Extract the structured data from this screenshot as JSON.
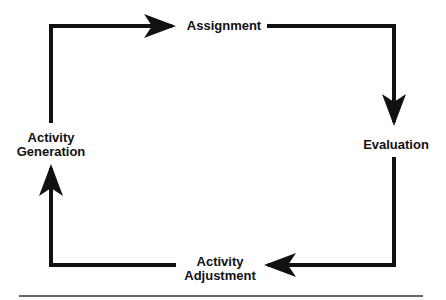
{
  "diagram": {
    "type": "cycle",
    "nodes": [
      {
        "id": "assignment",
        "lines": [
          "Assignment"
        ]
      },
      {
        "id": "evaluation",
        "lines": [
          "Evaluation"
        ]
      },
      {
        "id": "activity-adjustment",
        "lines": [
          "Activity",
          "Adjustment"
        ]
      },
      {
        "id": "activity-generation",
        "lines": [
          "Activity",
          "Generation"
        ]
      }
    ],
    "edges": [
      {
        "from": "activity-generation",
        "to": "assignment",
        "direction": "clockwise"
      },
      {
        "from": "assignment",
        "to": "evaluation",
        "direction": "clockwise"
      },
      {
        "from": "evaluation",
        "to": "activity-adjustment",
        "direction": "clockwise"
      },
      {
        "from": "activity-adjustment",
        "to": "activity-generation",
        "direction": "clockwise"
      }
    ],
    "colors": {
      "stroke": "#111111",
      "text": "#111111",
      "background": "#ffffff",
      "rule": "#333333"
    }
  }
}
